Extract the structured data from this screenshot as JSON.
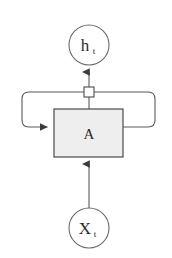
{
  "diagram": {
    "background_color": "#ffffff",
    "stroke_color": "#5a5a5a",
    "text_color": "#2b2b2b",
    "cell_fill_color": "#eeeeee",
    "connector_fill_color": "#ffffff",
    "nodes": {
      "output": {
        "label": "h",
        "subscript": "t",
        "shape": "circle",
        "cx": 89,
        "cy": 45,
        "r": 20
      },
      "cell": {
        "label": "A",
        "shape": "rect",
        "x": 54,
        "y": 109,
        "width": 69,
        "height": 48
      },
      "input": {
        "label": "X",
        "subscript": "t",
        "shape": "circle",
        "cx": 89,
        "cy": 228,
        "r": 20
      },
      "branch": {
        "label": "",
        "shape": "square",
        "x": 84,
        "y": 87,
        "size": 10
      }
    },
    "edges": [
      {
        "name": "input-to-cell",
        "from": "input",
        "to": "cell",
        "arrow": true
      },
      {
        "name": "cell-to-output",
        "from": "cell",
        "to": "output",
        "arrow": true
      },
      {
        "name": "recurrent-loop",
        "from": "branch",
        "to": "cell",
        "arrow": true
      }
    ]
  }
}
